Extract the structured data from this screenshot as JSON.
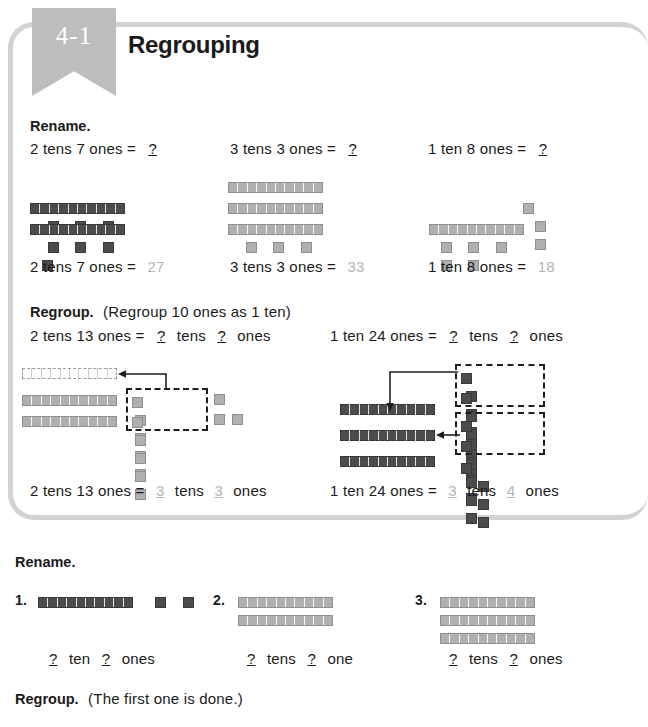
{
  "lesson": {
    "number": "4-1",
    "title": "Regrouping"
  },
  "section_rename_top": {
    "heading": "Rename.",
    "problems": [
      {
        "prompt_tens": "2 tens 7 ones",
        "equals": "=",
        "placeholder": "?",
        "answer": "27",
        "tens": 2,
        "ones": 7,
        "block_color": "dark"
      },
      {
        "prompt_tens": "3 tens 3 ones",
        "equals": "=",
        "placeholder": "?",
        "answer": "33",
        "tens": 3,
        "ones": 3,
        "block_color": "light"
      },
      {
        "prompt_tens": "1 ten 8 ones",
        "equals": "=",
        "placeholder": "?",
        "answer": "18",
        "tens": 1,
        "ones": 8,
        "block_color": "light"
      }
    ]
  },
  "section_regroup_top": {
    "heading": "Regroup.",
    "note": "(Regroup 10 ones as 1 ten)",
    "problems": [
      {
        "prompt": "2 tens 13 ones",
        "equals": "=",
        "placeholder_tens": "?",
        "label_tens": "tens",
        "placeholder_ones": "?",
        "label_ones": "ones",
        "answer_tens": "3",
        "answer_ones": "3",
        "block_color": "light",
        "rods_solid": 2,
        "rods_dashed": 1,
        "ones_in_box": 10,
        "ones_extra": 3
      },
      {
        "prompt": "1 ten 24 ones",
        "equals": "=",
        "placeholder_tens": "?",
        "label_tens": "tens",
        "placeholder_ones": "?",
        "label_ones": "ones",
        "answer_tens": "3",
        "answer_ones": "4",
        "block_color": "dark",
        "rods_solid": 1,
        "rods_dashed": 2,
        "ones_in_box": 10,
        "ones_boxes": 2,
        "ones_extra": 4
      }
    ]
  },
  "section_rename_bottom": {
    "heading": "Rename.",
    "items": [
      {
        "number": "1.",
        "placeholder_tens": "?",
        "label_tens": "ten",
        "placeholder_ones": "?",
        "label_ones": "ones",
        "tens": 1,
        "ones": 2,
        "block_color": "dark"
      },
      {
        "number": "2.",
        "placeholder_tens": "?",
        "label_tens": "tens",
        "placeholder_ones": "?",
        "label_ones": "one",
        "tens": 2,
        "ones": 1,
        "block_color": "light"
      },
      {
        "number": "3.",
        "placeholder_tens": "?",
        "label_tens": "tens",
        "placeholder_ones": "?",
        "label_ones": "ones",
        "tens": 3,
        "ones": 4,
        "block_color": "light"
      }
    ]
  },
  "section_regroup_bottom": {
    "heading": "Regroup.",
    "note": "(The first one is done.)"
  }
}
